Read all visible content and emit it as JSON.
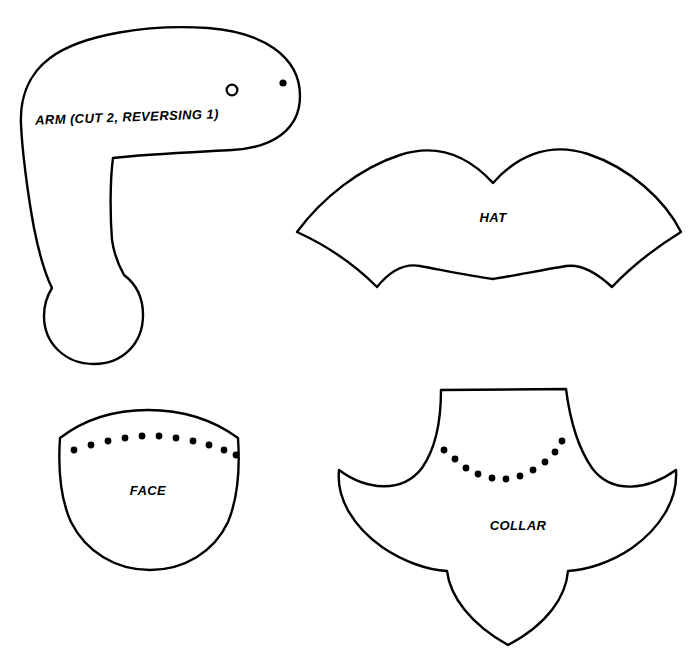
{
  "sheet": {
    "title": "Costume Pattern Pieces",
    "background_color": "#ffffff",
    "ink_color": "#000000",
    "width": 700,
    "height": 659
  },
  "pieces": [
    {
      "id": "arm",
      "label": "ARM (CUT 2, REVERSING 1)",
      "label_x": 127,
      "label_y": 118,
      "label_size": 13,
      "label_rotate": -2,
      "outline": "M 300 96 C 300 56 262 32 208 28 C 150 24 82 34 50 58 C 26 76 20 102 21 124 C 22 150 28 196 34 228 C 40 258 46 276 52 288 C 47 296 44 306 44 316 C 44 344 66 364 94 364 C 122 364 143 344 143 315 C 143 298 136 284 124 275 C 119 266 114 254 112 240 C 110 215 110 180 113 158 C 146 154 196 152 232 150 C 272 148 300 130 300 96 Z",
      "markers": [
        {
          "type": "circle-open",
          "cx": 232,
          "cy": 90,
          "r": 5.4
        },
        {
          "type": "dot-filled",
          "cx": 283,
          "cy": 83,
          "r": 3.6
        }
      ],
      "stitch_dots": []
    },
    {
      "id": "hat",
      "label": "HAT",
      "label_x": 493,
      "label_y": 219,
      "label_size": 13,
      "label_rotate": 0,
      "outline": "M 297 232 C 322 198 360 168 400 155 C 440 142 470 158 493 183 C 516 157 548 141 588 154 C 630 168 665 200 681 232 C 655 248 630 268 612 287 C 596 272 580 264 566 266 C 542 270 512 276 493 279 C 470 276 442 270 420 266 C 404 263 390 271 377 287 C 358 268 330 247 297 232 Z",
      "markers": [],
      "stitch_dots": []
    },
    {
      "id": "face",
      "label": "FACE",
      "label_x": 148,
      "label_y": 492,
      "label_size": 13,
      "label_rotate": 0,
      "outline": "M 60 438 C 86 418 116 410 148 410 C 180 410 212 419 238 438 C 240 468 238 498 228 522 C 214 552 184 570 150 570 C 116 570 86 552 71 522 C 60 498 58 468 60 438 Z",
      "markers": [],
      "stitch_dots": [
        {
          "cx": 74,
          "cy": 450
        },
        {
          "cx": 91,
          "cy": 445
        },
        {
          "cx": 108,
          "cy": 441
        },
        {
          "cx": 125,
          "cy": 438
        },
        {
          "cx": 142,
          "cy": 436
        },
        {
          "cx": 159,
          "cy": 436
        },
        {
          "cx": 176,
          "cy": 438
        },
        {
          "cx": 193,
          "cy": 441
        },
        {
          "cx": 209,
          "cy": 445
        },
        {
          "cx": 224,
          "cy": 450
        },
        {
          "cx": 236,
          "cy": 455
        }
      ]
    },
    {
      "id": "collar",
      "label": "COLLAR",
      "label_x": 518,
      "label_y": 527,
      "label_size": 13,
      "label_rotate": 0,
      "outline": "M 441 390 L 566 389 C 570 420 578 448 592 468 C 612 495 648 490 676 470 C 678 500 660 528 632 548 C 610 563 586 570 568 571 C 566 596 548 624 508 645 C 470 624 450 596 447 571 C 428 570 404 562 382 547 C 354 527 336 499 339 470 C 366 490 402 494 422 468 C 436 448 441 420 441 390 Z",
      "markers": [],
      "stitch_dots": [
        {
          "cx": 444,
          "cy": 450
        },
        {
          "cx": 455,
          "cy": 459
        },
        {
          "cx": 466,
          "cy": 468
        },
        {
          "cx": 478,
          "cy": 474
        },
        {
          "cx": 492,
          "cy": 478
        },
        {
          "cx": 506,
          "cy": 479
        },
        {
          "cx": 520,
          "cy": 476
        },
        {
          "cx": 533,
          "cy": 470
        },
        {
          "cx": 545,
          "cy": 462
        },
        {
          "cx": 555,
          "cy": 452
        },
        {
          "cx": 562,
          "cy": 441
        }
      ]
    }
  ],
  "stitch_dot_radius": 3.4
}
